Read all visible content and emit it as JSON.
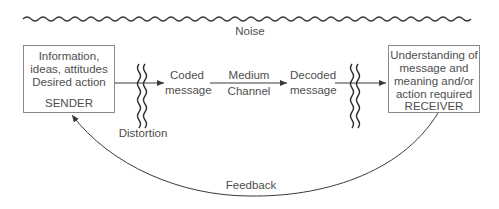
{
  "diagram": {
    "type": "communication-process-model",
    "noise": {
      "label": "Noise"
    },
    "sender": {
      "lines": [
        "Information,",
        "ideas, attitudes",
        "Desired action"
      ],
      "role": "SENDER"
    },
    "distortion": {
      "label": "Distortion"
    },
    "coded_message": {
      "lines": [
        "Coded",
        "message"
      ]
    },
    "medium": {
      "top": "Medium",
      "bottom": "Channel"
    },
    "decoded_message": {
      "lines": [
        "Decoded",
        "message"
      ]
    },
    "receiver": {
      "lines": [
        "Understanding of",
        "message and",
        "meaning and/or",
        "action required"
      ],
      "role": "RECEIVER"
    },
    "feedback": {
      "label": "Feedback"
    },
    "colors": {
      "line": "#3a3a3a",
      "box_border": "#8a8a8a",
      "text": "#4e4e4e"
    }
  }
}
